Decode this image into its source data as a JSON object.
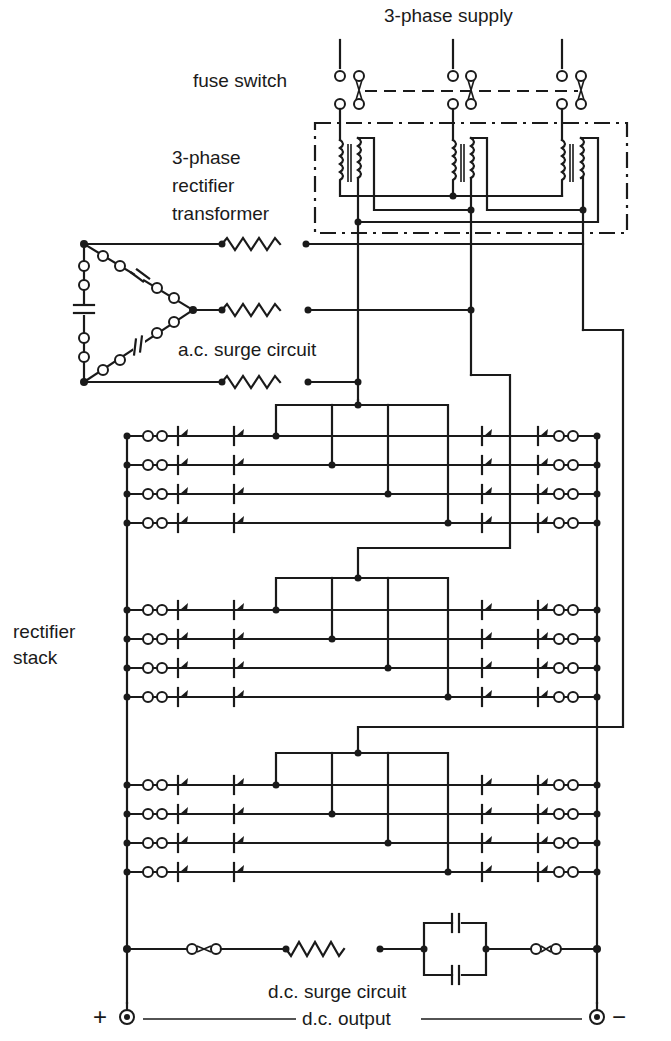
{
  "diagram": {
    "colors": {
      "ink": "#1a1a1a",
      "paper": "#ffffff"
    },
    "labels": {
      "supply": "3-phase supply",
      "fuse_switch": "fuse switch",
      "transformer_line1": "3-phase",
      "transformer_line2": "rectifier",
      "transformer_line3": "transformer",
      "ac_surge": "a.c. surge circuit",
      "stack_line1": "rectifier",
      "stack_line2": "stack",
      "dc_surge": "d.c. surge circuit",
      "dc_output": "d.c. output",
      "plus": "+",
      "minus": "−"
    },
    "blocks": [
      {
        "id": "supply",
        "label": "3-phase supply",
        "phases": 3
      },
      {
        "id": "fuse-switch",
        "label": "fuse switch",
        "components": [
          "fuse",
          "fuse",
          "fuse"
        ],
        "ganged": true
      },
      {
        "id": "transformer",
        "label": "3-phase rectifier transformer",
        "windings": 3
      },
      {
        "id": "ac-surge",
        "label": "a.c. surge circuit",
        "components": [
          "resistor x3",
          "capacitor x3",
          "fuse x6"
        ],
        "topology": "delta"
      },
      {
        "id": "rectifier-stack",
        "label": "rectifier stack",
        "groups": 3,
        "rows_per_group": 4,
        "diodes_per_row": 4,
        "fuses_per_row": 2
      },
      {
        "id": "dc-surge",
        "label": "d.c. surge circuit",
        "components": [
          "fuse",
          "resistor",
          "capacitor x2 (parallel)",
          "fuse"
        ]
      },
      {
        "id": "dc-output",
        "label": "d.c. output",
        "terminals": [
          "+",
          "−"
        ]
      }
    ]
  }
}
